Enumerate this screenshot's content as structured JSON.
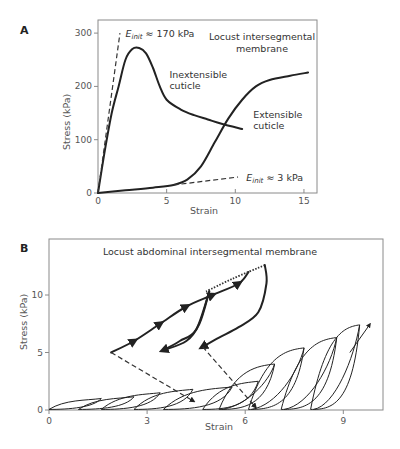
{
  "chart_data": [
    {
      "panel": "A",
      "type": "line",
      "title": "Locust intersegmental membrane",
      "xlabel": "Strain",
      "ylabel": "Stress (kPa)",
      "xlim": [
        0,
        16
      ],
      "ylim": [
        0,
        320
      ],
      "xticks": [
        0,
        5,
        10,
        15
      ],
      "yticks": [
        0,
        100,
        200,
        300
      ],
      "grid": false,
      "series": [
        {
          "name": "Inextensible cuticle",
          "style": "solid",
          "x": [
            0,
            0.5,
            1,
            1.5,
            2,
            2.5,
            3,
            3.5,
            4,
            4.5,
            5,
            6,
            7,
            8,
            9,
            10.5
          ],
          "y": [
            0,
            80,
            150,
            200,
            250,
            270,
            272,
            262,
            235,
            200,
            175,
            157,
            146,
            138,
            130,
            120
          ]
        },
        {
          "name": "Extensible cuticle",
          "style": "solid",
          "x": [
            0,
            2,
            4,
            5.5,
            6.5,
            7.5,
            8.5,
            9.5,
            10.5,
            11.5,
            12.5,
            14,
            15.3
          ],
          "y": [
            0,
            5,
            10,
            15,
            25,
            50,
            95,
            140,
            175,
            200,
            212,
            220,
            226
          ]
        },
        {
          "name": "E_init ≈ 170 kPa",
          "style": "dashed",
          "x": [
            0,
            1.6
          ],
          "y": [
            0,
            300
          ]
        },
        {
          "name": "E_init ≈ 3 kPa",
          "style": "dashed",
          "x": [
            5.5,
            10.2
          ],
          "y": [
            15,
            30
          ]
        }
      ],
      "annotations": [
        {
          "text_main": "E",
          "text_sub": "init",
          "text_rest": " ≈ 170 kPa",
          "at": [
            2,
            300
          ]
        },
        {
          "text_main": "E",
          "text_sub": "init",
          "text_rest": " ≈ 3 kPa",
          "at": [
            10.8,
            30
          ]
        },
        {
          "text": "Inextensible",
          "text2": "cuticle",
          "at": [
            5.2,
            215
          ]
        },
        {
          "text": "Extensible",
          "text2": "cuticle",
          "at": [
            11.3,
            140
          ]
        }
      ]
    },
    {
      "panel": "B",
      "type": "line",
      "title": "Locust abdominal intersegmental membrane",
      "xlabel": "Strain",
      "ylabel": "Stress (kPa)",
      "xlim": [
        0,
        10.2
      ],
      "ylim": [
        0,
        14.8
      ],
      "xticks": [
        0,
        3,
        6,
        9
      ],
      "yticks": [
        0,
        5,
        10
      ],
      "grid": false,
      "small_loops": [
        {
          "start": 0.0,
          "end": 1.6,
          "peak": 1.0
        },
        {
          "start": 0.9,
          "end": 2.6,
          "peak": 1.15
        },
        {
          "start": 1.6,
          "end": 3.4,
          "peak": 1.5
        },
        {
          "start": 2.6,
          "end": 4.4,
          "peak": 1.8
        },
        {
          "start": 3.5,
          "end": 5.6,
          "peak": 2.0
        },
        {
          "start": 4.7,
          "end": 6.4,
          "peak": 2.5
        },
        {
          "start": 5.2,
          "end": 6.9,
          "peak": 4.0
        },
        {
          "start": 6.1,
          "end": 7.8,
          "peak": 5.4
        },
        {
          "start": 7.1,
          "end": 8.8,
          "peak": 6.3
        },
        {
          "start": 8.0,
          "end": 9.5,
          "peak": 7.4
        }
      ],
      "large_loop": {
        "loading": {
          "x": [
            1.9,
            2.6,
            3.4,
            4.2,
            5.0,
            5.8,
            6.1
          ],
          "y": [
            5.0,
            6.0,
            7.5,
            9.0,
            10.0,
            11.0,
            12.0
          ]
        },
        "loading_dotted": {
          "x": [
            4.8,
            5.6,
            6.6
          ],
          "y": [
            10.3,
            11.4,
            12.6
          ]
        },
        "unloading_big": {
          "x": [
            6.6,
            6.65,
            6.4,
            5.8,
            5.2,
            4.7
          ],
          "y": [
            12.6,
            11.0,
            8.5,
            7.2,
            6.3,
            5.5
          ]
        },
        "inner_loop_up": {
          "x": [
            3.5,
            4.0,
            4.5,
            4.9
          ],
          "y": [
            5.2,
            6.0,
            7.0,
            10.3
          ]
        },
        "inner_loop_down": {
          "x": [
            4.9,
            4.6,
            4.2,
            3.5
          ],
          "y": [
            10.3,
            7.5,
            6.0,
            5.2
          ]
        }
      },
      "dashed_arrows": [
        {
          "x": [
            1.9,
            4.4
          ],
          "y": [
            5.0,
            0.8
          ]
        },
        {
          "x": [
            4.7,
            6.3
          ],
          "y": [
            5.5,
            0.3
          ]
        }
      ],
      "final_arrow": {
        "x": [
          9.2,
          9.8
        ],
        "y": [
          5.0,
          7.4
        ]
      }
    }
  ],
  "labels": {
    "panel_a": "A",
    "panel_b": "B"
  }
}
